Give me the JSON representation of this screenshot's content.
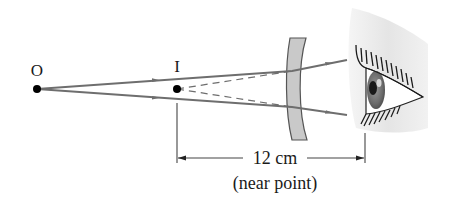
{
  "diagram": {
    "type": "optics-ray-diagram",
    "points": {
      "object": {
        "label": "O"
      },
      "image": {
        "label": "I"
      }
    },
    "dimension": {
      "value": "12 cm",
      "caption": "(near point)"
    },
    "elements": [
      "object-point",
      "image-point",
      "diverging-lens",
      "eye",
      "rays",
      "virtual-rays",
      "dimension-line"
    ],
    "colors": {
      "ray": "#6e6e6e",
      "lens_fill": "#c9c9c9",
      "lens_stroke": "#555555",
      "text": "#1a1a1a",
      "point": "#000000"
    }
  }
}
